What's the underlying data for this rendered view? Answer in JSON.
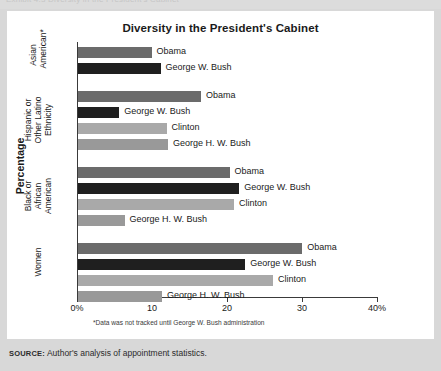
{
  "top_clip_text": "Exhibit 4.3  Diversity in the President's Cabinet",
  "card": {
    "title": "Diversity in the President's Cabinet",
    "y_axis_title": "Percentage",
    "footnote": "*Data was not tracked until George W. Bush administration"
  },
  "source": {
    "label": "SOURCE:",
    "text": " Author's analysis of appointment statistics."
  },
  "colors": {
    "obama": "#6b6b6b",
    "george_w_bush": "#1f1f1f",
    "clinton": "#a9a9a9",
    "george_hw_bush": "#999999",
    "card_background": "#ffffff",
    "page_background": "#d8d8d8",
    "axis": "#3a3a3a",
    "text": "#1a1a1a"
  },
  "chart_data": {
    "type": "bar",
    "orientation": "horizontal",
    "title": "Diversity in the President's Cabinet",
    "xlabel": "",
    "ylabel": "Percentage",
    "xlim": [
      0,
      40
    ],
    "grid": false,
    "legend": "inline-labels",
    "xticks": [
      "0%",
      "10",
      "20",
      "30",
      "40%"
    ],
    "xtick_values": [
      0,
      10,
      20,
      30,
      40
    ],
    "groups": [
      {
        "category": "Asian American*",
        "category_lines": "Asian\nAmerican*",
        "bars": [
          {
            "name": "Obama",
            "value": 9.8,
            "color_key": "obama"
          },
          {
            "name": "George W. Bush",
            "value": 11.0,
            "color_key": "george_w_bush"
          }
        ]
      },
      {
        "category": "Hispanic or Other Latino Ethnicity",
        "category_lines": "Hispanic or\nOther Latino\nEthnicity",
        "bars": [
          {
            "name": "Obama",
            "value": 16.4,
            "color_key": "obama"
          },
          {
            "name": "George W. Bush",
            "value": 5.5,
            "color_key": "george_w_bush"
          },
          {
            "name": "Clinton",
            "value": 11.8,
            "color_key": "clinton"
          },
          {
            "name": "George H. W. Bush",
            "value": 12.0,
            "color_key": "george_hw_bush"
          }
        ]
      },
      {
        "category": "Black or African American",
        "category_lines": "Black or African\nAmerican",
        "bars": [
          {
            "name": "Obama",
            "value": 20.2,
            "color_key": "obama"
          },
          {
            "name": "George W. Bush",
            "value": 21.5,
            "color_key": "george_w_bush"
          },
          {
            "name": "Clinton",
            "value": 20.8,
            "color_key": "clinton"
          },
          {
            "name": "George H. W. Bush",
            "value": 6.2,
            "color_key": "george_hw_bush"
          }
        ]
      },
      {
        "category": "Women",
        "category_lines": "Women",
        "bars": [
          {
            "name": "Obama",
            "value": 29.9,
            "color_key": "obama"
          },
          {
            "name": "George W. Bush",
            "value": 22.3,
            "color_key": "george_w_bush"
          },
          {
            "name": "Clinton",
            "value": 26.0,
            "color_key": "clinton"
          },
          {
            "name": "George H. W. Bush",
            "value": 11.2,
            "color_key": "george_hw_bush"
          }
        ]
      }
    ]
  }
}
